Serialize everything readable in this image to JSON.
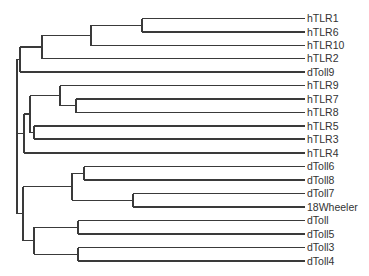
{
  "diagram": {
    "type": "phylogenetic-tree",
    "line_color": "#3a3a3a",
    "label_color": "#333333",
    "leaf_x_end": 305,
    "label_x": 307,
    "leaves": [
      {
        "id": "hTLR1",
        "label": "hTLR1",
        "y": 18.5
      },
      {
        "id": "hTLR6",
        "label": "hTLR6",
        "y": 32
      },
      {
        "id": "hTLR10",
        "label": "hTLR10",
        "y": 45.5
      },
      {
        "id": "hTLR2",
        "label": "hTLR2",
        "y": 58.5
      },
      {
        "id": "dToll9",
        "label": "dToll9",
        "y": 72
      },
      {
        "id": "hTLR9",
        "label": "hTLR9",
        "y": 85.5
      },
      {
        "id": "hTLR7",
        "label": "hTLR7",
        "y": 99
      },
      {
        "id": "hTLR8",
        "label": "hTLR8",
        "y": 112.5
      },
      {
        "id": "hTLR5",
        "label": "hTLR5",
        "y": 126
      },
      {
        "id": "hTLR3",
        "label": "hTLR3",
        "y": 139
      },
      {
        "id": "hTLR4",
        "label": "hTLR4",
        "y": 153
      },
      {
        "id": "dToll6",
        "label": "dToll6",
        "y": 166.5
      },
      {
        "id": "dToll8",
        "label": "dToll8",
        "y": 180
      },
      {
        "id": "dToll7",
        "label": "dToll7",
        "y": 193.5
      },
      {
        "id": "18Wheeler",
        "label": "18Wheeler",
        "y": 207
      },
      {
        "id": "dToll",
        "label": "dToll",
        "y": 220.5
      },
      {
        "id": "dToll5",
        "label": "dToll5",
        "y": 234
      },
      {
        "id": "dToll3",
        "label": "dToll3",
        "y": 247.5
      },
      {
        "id": "dToll4",
        "label": "dToll4",
        "y": 261
      }
    ],
    "nodes": [
      {
        "id": "n_1_6",
        "x": 142,
        "children": [
          "hTLR1",
          "hTLR6"
        ]
      },
      {
        "id": "n_1_6_10",
        "x": 91,
        "children": [
          "n_1_6",
          "hTLR10"
        ]
      },
      {
        "id": "n_a",
        "x": 42,
        "children": [
          "n_1_6_10",
          "hTLR2"
        ]
      },
      {
        "id": "n_b",
        "x": 20,
        "children": [
          "n_a",
          "dToll9"
        ]
      },
      {
        "id": "n_7_8",
        "x": 76,
        "children": [
          "hTLR7",
          "hTLR8"
        ]
      },
      {
        "id": "n_9_7_8",
        "x": 60,
        "children": [
          "hTLR9",
          "n_7_8"
        ]
      },
      {
        "id": "n_5_3",
        "x": 34,
        "children": [
          "hTLR5",
          "hTLR3"
        ]
      },
      {
        "id": "n_c",
        "x": 30,
        "children": [
          "n_9_7_8",
          "n_5_3"
        ]
      },
      {
        "id": "n_d",
        "x": 24,
        "children": [
          "n_c",
          "hTLR4"
        ]
      },
      {
        "id": "n_6_8",
        "x": 84,
        "children": [
          "dToll6",
          "dToll8"
        ]
      },
      {
        "id": "n_7_18",
        "x": 133,
        "children": [
          "dToll7",
          "18Wheeler"
        ]
      },
      {
        "id": "n_e",
        "x": 72,
        "children": [
          "n_6_8",
          "n_7_18"
        ]
      },
      {
        "id": "n_toll_5",
        "x": 78,
        "children": [
          "dToll",
          "dToll5"
        ]
      },
      {
        "id": "n_3_4",
        "x": 78,
        "children": [
          "dToll3",
          "dToll4"
        ]
      },
      {
        "id": "n_f",
        "x": 34,
        "children": [
          "n_toll_5",
          "n_3_4"
        ]
      },
      {
        "id": "n_g",
        "x": 23,
        "children": [
          "n_e",
          "n_f"
        ]
      },
      {
        "id": "root",
        "x": 17,
        "children": [
          "n_b",
          "n_d",
          "n_g"
        ]
      }
    ]
  }
}
